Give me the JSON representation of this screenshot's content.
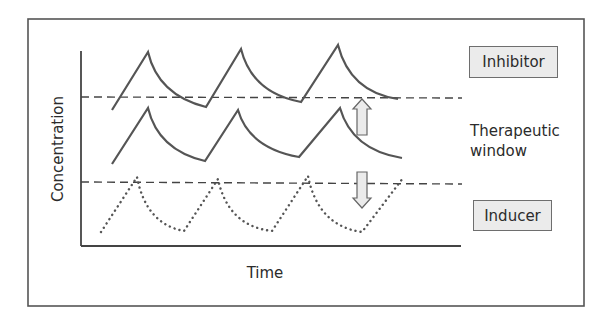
{
  "figure": {
    "title": "",
    "x_axis_label": "Time",
    "y_axis_label": "Concentration",
    "labels": {
      "inhibitor": "Inhibitor",
      "inducer": "Inducer",
      "therapeutic_window_line1": "Therapeutic",
      "therapeutic_window_line2": "window"
    },
    "colors": {
      "line": "#555555",
      "axis": "#444444",
      "frame": "#555555",
      "arrow_fill": "#ebebeb",
      "arrow_stroke": "#666666",
      "tag_fill": "#ebebeb"
    },
    "thresholds": {
      "upper_dashed_y_px": 97,
      "lower_dashed_y_px": 182
    },
    "curves": [
      {
        "name": "Inhibitor (raised concentration)",
        "style": "solid",
        "points": [
          [
            112,
            110
          ],
          [
            148,
            52
          ],
          [
            206,
            107
          ],
          [
            241,
            49
          ],
          [
            301,
            102
          ],
          [
            338,
            45
          ],
          [
            398,
            99
          ]
        ]
      },
      {
        "name": "Normal (within therapeutic window)",
        "style": "solid",
        "points": [
          [
            112,
            164
          ],
          [
            148,
            108
          ],
          [
            205,
            161
          ],
          [
            238,
            110
          ],
          [
            299,
            157
          ],
          [
            340,
            108
          ],
          [
            402,
            158
          ]
        ]
      },
      {
        "name": "Inducer (lowered concentration)",
        "style": "dotted",
        "points": [
          [
            101,
            232
          ],
          [
            137,
            177
          ],
          [
            184,
            231
          ],
          [
            218,
            179
          ],
          [
            272,
            231
          ],
          [
            308,
            176
          ],
          [
            362,
            232
          ],
          [
            403,
            178
          ]
        ]
      }
    ],
    "arrows": [
      {
        "name": "increase-arrow",
        "direction": "up",
        "x": 362,
        "y_top": 99,
        "y_bottom": 135
      },
      {
        "name": "decrease-arrow",
        "direction": "down",
        "x": 362,
        "y_top": 172,
        "y_bottom": 208
      }
    ]
  }
}
